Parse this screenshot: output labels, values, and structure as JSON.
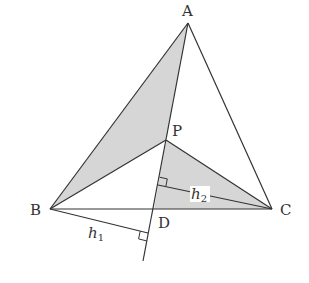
{
  "diagram": {
    "colors": {
      "stroke": "#333333",
      "shade": "#d6d6d6",
      "background": "#ffffff"
    },
    "points": {
      "A": {
        "label": "A",
        "x": 188,
        "y": 23
      },
      "B": {
        "label": "B",
        "x": 50,
        "y": 209
      },
      "C": {
        "label": "C",
        "x": 272,
        "y": 209
      },
      "P": {
        "label": "P",
        "x": 166,
        "y": 140
      },
      "D": {
        "label": "D",
        "x": 154,
        "y": 209
      }
    },
    "segments": [
      {
        "name": "AB",
        "from": "A",
        "to": "B"
      },
      {
        "name": "AC",
        "from": "A",
        "to": "C"
      },
      {
        "name": "BC",
        "from": "B",
        "to": "C"
      },
      {
        "name": "AP",
        "from": "A",
        "to": "P"
      },
      {
        "name": "BP",
        "from": "B",
        "to": "P"
      },
      {
        "name": "CP",
        "from": "C",
        "to": "P"
      },
      {
        "name": "PD-extended",
        "from": "P",
        "to": "end"
      }
    ],
    "heights": [
      {
        "label": "h",
        "subscript": "1",
        "from": "B",
        "foot": {
          "x": 148,
          "y": 233
        }
      },
      {
        "label": "h",
        "subscript": "2",
        "from": "C",
        "foot": {
          "x": 158,
          "y": 185
        }
      }
    ],
    "shaded_regions": [
      "triangle ABP",
      "quadrilateral P-D-C region (triangle PDC)"
    ],
    "labels": {
      "A": "A",
      "B": "B",
      "C": "C",
      "P": "P",
      "D": "D",
      "h1": {
        "base": "h",
        "sub": "1"
      },
      "h2": {
        "base": "h",
        "sub": "2"
      }
    }
  }
}
